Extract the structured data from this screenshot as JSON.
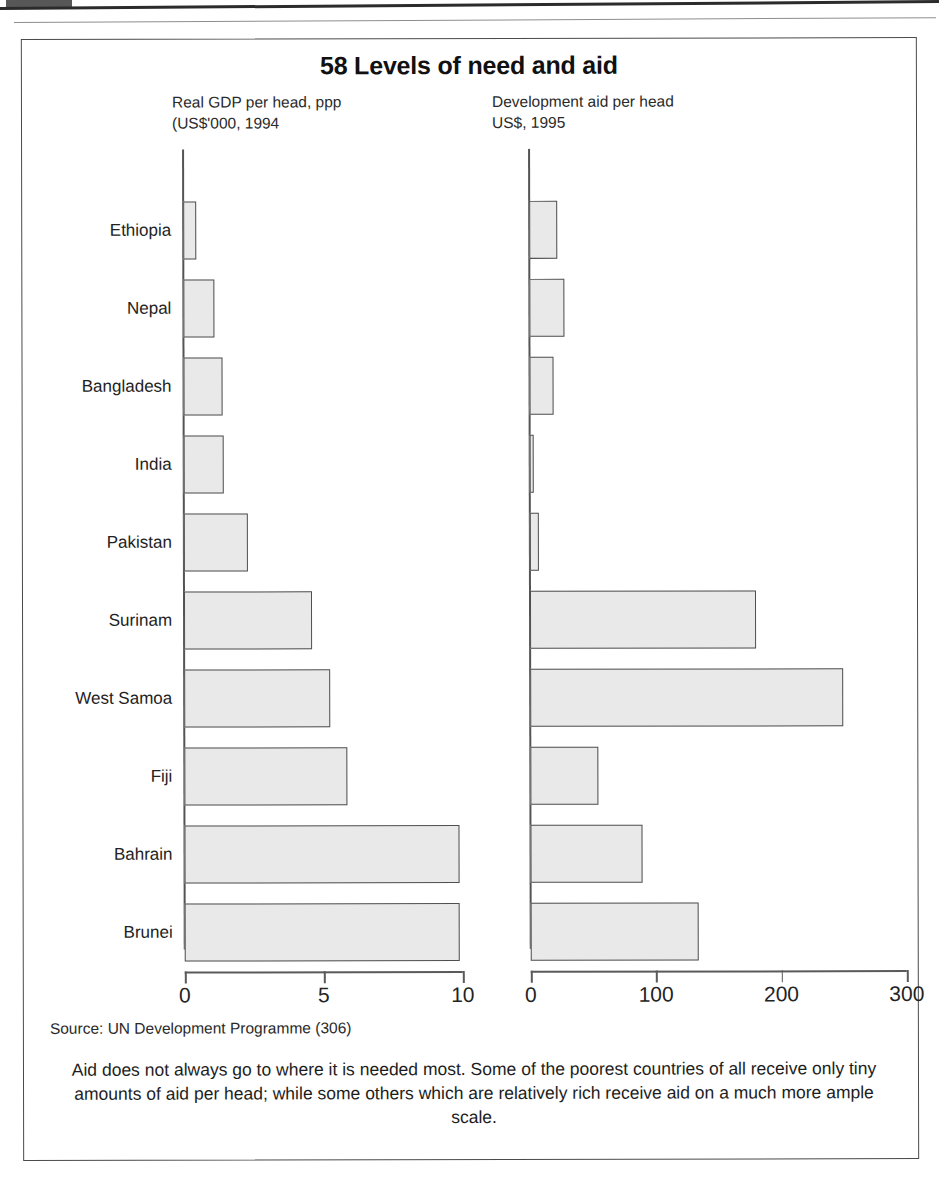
{
  "figure": {
    "title": "58 Levels of need and aid",
    "source": "Source: UN Development Programme (306)",
    "caption": "Aid does not always go to where it is needed most. Some of the poorest countries of all receive only tiny amounts of aid per head; while some others which are relatively rich receive aid on a much more ample scale.",
    "frame_color": "#4a4a4a",
    "bar_fill": "#e9e9e9",
    "bar_stroke": "#4f4f4f"
  },
  "chart_data": [
    {
      "type": "bar",
      "orientation": "horizontal",
      "title": "Real GDP per head, ppp\n(US$'000, 1994",
      "xlabel": "",
      "ylabel": "",
      "xlim": [
        0,
        10
      ],
      "xticks": [
        0,
        5,
        10
      ],
      "xtick_labels": [
        "0",
        "5",
        "10"
      ],
      "grid": false,
      "legend": "none",
      "categories": [
        "Ethiopia",
        "Nepal",
        "Bangladesh",
        "India",
        "Pakistan",
        "Surinam",
        "West Samoa",
        "Fiji",
        "Bahrain",
        "Brunei"
      ],
      "values": [
        0.45,
        1.1,
        1.4,
        1.45,
        2.3,
        4.6,
        5.25,
        5.85,
        9.9,
        9.9
      ]
    },
    {
      "type": "bar",
      "orientation": "horizontal",
      "title": "Development aid per head\nUS$, 1995",
      "xlabel": "",
      "ylabel": "",
      "xlim": [
        0,
        300
      ],
      "xticks": [
        0,
        100,
        200,
        300
      ],
      "xtick_labels": [
        "0",
        "100",
        "200",
        "300"
      ],
      "grid": false,
      "legend": "none",
      "categories": [
        "Ethiopia",
        "Nepal",
        "Bangladesh",
        "India",
        "Pakistan",
        "Surinam",
        "West Samoa",
        "Fiji",
        "Bahrain",
        "Brunei"
      ],
      "values": [
        22,
        28,
        19,
        3,
        7,
        180,
        250,
        54,
        89,
        134
      ]
    }
  ]
}
